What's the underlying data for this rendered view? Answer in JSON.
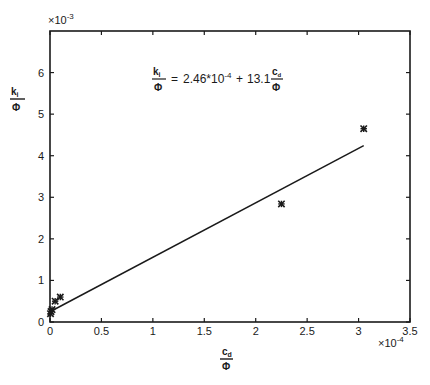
{
  "chart_data": {
    "type": "scatter",
    "title": "",
    "xlabel": {
      "numerator": "c",
      "numerator_sub": "d",
      "denominator": "Φ"
    },
    "ylabel": {
      "numerator": "k",
      "numerator_sub": "i",
      "denominator": "Φ"
    },
    "x_multiplier": "×10",
    "x_multiplier_exp": "-4",
    "y_multiplier": "×10",
    "y_multiplier_exp": "-3",
    "xlim": [
      0,
      3.5
    ],
    "ylim": [
      0,
      7
    ],
    "xticks": [
      0,
      0.5,
      1,
      1.5,
      2,
      2.5,
      3,
      3.5
    ],
    "xtick_labels": [
      "0",
      "0.5",
      "1",
      "1.5",
      "2",
      "2.5",
      "3",
      "3.5"
    ],
    "yticks": [
      0,
      1,
      2,
      3,
      4,
      5,
      6
    ],
    "ytick_labels": [
      "0",
      "1",
      "2",
      "3",
      "4",
      "5",
      "6"
    ],
    "grid": false,
    "series": [
      {
        "name": "measured",
        "marker": "asterisk",
        "points": [
          {
            "x": 0.005,
            "y": 0.2
          },
          {
            "x": 0.01,
            "y": 0.25
          },
          {
            "x": 0.02,
            "y": 0.3
          },
          {
            "x": 0.05,
            "y": 0.5
          },
          {
            "x": 0.1,
            "y": 0.6
          },
          {
            "x": 2.25,
            "y": 2.84
          },
          {
            "x": 3.05,
            "y": 4.65
          }
        ]
      },
      {
        "name": "fit",
        "type": "line",
        "intercept": 0.246,
        "slope": 1.31,
        "x_range": [
          0,
          3.05
        ]
      }
    ],
    "annotation": {
      "lhs_num": "k",
      "lhs_num_sub": "i",
      "lhs_den": "Φ",
      "equals": "=",
      "intercept_text": "2.46*10",
      "intercept_exp": "-4",
      "plus": "+",
      "coef": "13.1",
      "rhs_num": "c",
      "rhs_num_sub": "d",
      "rhs_den": "Φ"
    }
  }
}
